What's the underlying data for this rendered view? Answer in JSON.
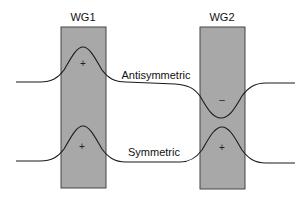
{
  "diagram": {
    "waveguides": [
      {
        "id": "wg1",
        "label": "WG1",
        "x": 61,
        "y": 27,
        "width": 45,
        "height": 161,
        "fill": "#a8a8a8",
        "stroke": "#444444"
      },
      {
        "id": "wg2",
        "label": "WG2",
        "x": 200,
        "y": 27,
        "width": 45,
        "height": 162,
        "fill": "#a8a8a8",
        "stroke": "#444444"
      }
    ],
    "modes": [
      {
        "id": "antisymmetric",
        "label": "Antisymmetric",
        "baseline_y": 82,
        "lobes": [
          {
            "waveguide": "WG1",
            "sign": "+",
            "extreme_y": 47
          },
          {
            "waveguide": "WG2",
            "sign": "–",
            "extreme_y": 118
          }
        ]
      },
      {
        "id": "symmetric",
        "label": "Symmetric",
        "baseline_y": 162,
        "lobes": [
          {
            "waveguide": "WG1",
            "sign": "+",
            "extreme_y": 126
          },
          {
            "waveguide": "WG2",
            "sign": "+",
            "extreme_y": 127
          }
        ]
      }
    ],
    "colors": {
      "background": "#ffffff",
      "waveguide_fill": "#a8a8a8",
      "waveguide_stroke": "#444444",
      "curve": "#1a1a1a",
      "text": "#111111"
    }
  }
}
